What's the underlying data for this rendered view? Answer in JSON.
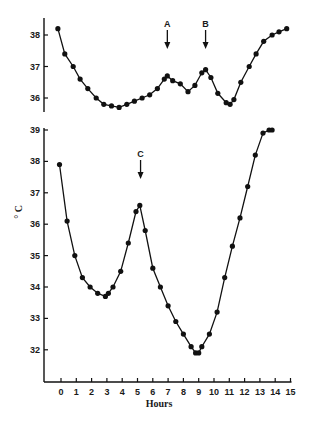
{
  "chart_data": [
    {
      "type": "line",
      "panel": "top",
      "title": "",
      "xlabel": "",
      "ylabel": "",
      "ylim": [
        35.6,
        38.6
      ],
      "yticks": [
        36,
        37,
        38
      ],
      "ytick_labels": [
        "36",
        "37",
        "38"
      ],
      "grid": false,
      "annotations": [
        {
          "label": "A",
          "x": 6.95,
          "type": "down-arrow"
        },
        {
          "label": "B",
          "x": 9.45,
          "type": "down-arrow"
        }
      ],
      "series": [
        {
          "name": "temperature",
          "x": [
            -0.2,
            0.25,
            0.8,
            1.25,
            1.75,
            2.3,
            2.8,
            3.3,
            3.8,
            4.3,
            4.8,
            5.3,
            5.8,
            6.3,
            6.75,
            6.95,
            7.3,
            7.8,
            8.3,
            8.75,
            9.2,
            9.45,
            9.8,
            10.25,
            10.8,
            11.05,
            11.3,
            11.75,
            12.3,
            12.75,
            13.25,
            13.8,
            14.25,
            14.75
          ],
          "values": [
            38.2,
            37.4,
            37.0,
            36.6,
            36.3,
            36.0,
            35.8,
            35.75,
            35.7,
            35.8,
            35.9,
            36.0,
            36.1,
            36.3,
            36.6,
            36.7,
            36.55,
            36.45,
            36.2,
            36.4,
            36.8,
            36.9,
            36.65,
            36.15,
            35.85,
            35.8,
            35.95,
            36.5,
            37.0,
            37.4,
            37.8,
            38.0,
            38.1,
            38.2
          ]
        }
      ]
    },
    {
      "type": "line",
      "panel": "bottom",
      "title": "",
      "xlabel": "Hours",
      "ylabel": "° C",
      "xlim": [
        -1.2,
        15
      ],
      "ylim": [
        31,
        39.2
      ],
      "xticks": [
        0,
        1,
        2,
        3,
        4,
        5,
        6,
        7,
        8,
        9,
        10,
        11,
        12,
        13,
        14,
        15
      ],
      "xtick_labels": [
        "0",
        "1",
        "2",
        "3",
        "4",
        "5",
        "6",
        "7",
        "8",
        "9",
        "10",
        "11",
        "12",
        "13",
        "14",
        "15"
      ],
      "yticks": [
        32,
        33,
        34,
        35,
        36,
        37,
        38,
        39
      ],
      "ytick_labels": [
        "32",
        "33",
        "34",
        "35",
        "36",
        "37",
        "38",
        "39"
      ],
      "grid": false,
      "annotations": [
        {
          "label": "C",
          "x": 5.2,
          "type": "down-arrow"
        }
      ],
      "series": [
        {
          "name": "temperature",
          "x": [
            -0.1,
            0.4,
            0.9,
            1.4,
            1.9,
            2.4,
            2.9,
            3.1,
            3.4,
            3.9,
            4.4,
            4.9,
            5.15,
            5.5,
            6.0,
            6.5,
            7.0,
            7.5,
            8.0,
            8.5,
            8.8,
            9.0,
            9.2,
            9.7,
            10.2,
            10.7,
            11.2,
            11.7,
            12.2,
            12.7,
            13.2,
            13.6,
            13.8
          ],
          "values": [
            37.9,
            36.1,
            35.0,
            34.3,
            34.0,
            33.8,
            33.7,
            33.8,
            34.0,
            34.5,
            35.4,
            36.4,
            36.6,
            35.8,
            34.6,
            34.0,
            33.4,
            32.9,
            32.5,
            32.1,
            31.9,
            31.9,
            32.1,
            32.5,
            33.2,
            34.3,
            35.3,
            36.2,
            37.2,
            38.2,
            38.9,
            39.0,
            39.0
          ]
        }
      ]
    }
  ]
}
